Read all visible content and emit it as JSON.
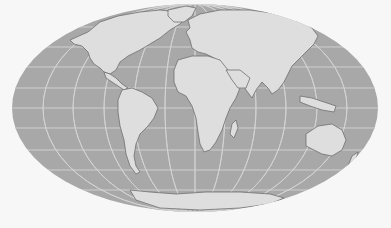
{
  "map": {
    "projection": "Mollweide",
    "type": "world map",
    "colors": {
      "background": "#f7f7f7",
      "ocean": "#a8a8a8",
      "land": "#dedede",
      "graticule": "#d4d4d4",
      "coastline": "#707070"
    },
    "ellipse": {
      "cx": 195,
      "cy": 108,
      "rx": 183,
      "ry": 104
    },
    "parallels_y": [
      27,
      47,
      67,
      88,
      108,
      128,
      150,
      170,
      190
    ],
    "meridian_rx": [
      0,
      30,
      61,
      91,
      122,
      152
    ],
    "continents": [
      {
        "name": "North America",
        "d": "M70,40 L88,32 L100,22 L118,16 L140,12 L160,10 L178,12 L186,18 L180,24 L170,30 L160,38 L150,44 L140,50 L128,56 L120,62 L116,70 L110,74 L104,72 L100,68 L94,64 L90,58 L88,52 L82,46 L74,44 Z"
      },
      {
        "name": "Greenland",
        "d": "M168,10 L186,6 L196,8 L192,16 L184,22 L174,22 L168,16 Z"
      },
      {
        "name": "Central America",
        "d": "M104,72 L110,74 L116,78 L122,84 L128,88 L124,90 L118,86 L112,82 L106,78 Z"
      },
      {
        "name": "South America",
        "d": "M122,90 L132,88 L142,92 L152,98 L158,108 L154,118 L148,126 L140,134 L136,144 L134,156 L136,166 L140,172 L136,174 L130,166 L126,154 L124,140 L120,126 L118,112 L118,100 Z"
      },
      {
        "name": "Europe-Asia",
        "d": "M188,20 L200,14 L220,10 L250,10 L280,14 L300,20 L312,28 L318,36 L314,44 L308,50 L300,58 L292,66 L288,74 L284,82 L278,90 L272,94 L268,88 L262,82 L256,90 L252,98 L246,90 L240,80 L232,76 L224,72 L218,66 L214,58 L206,54 L198,52 L192,48 L190,40 L186,32 L190,28 Z"
      },
      {
        "name": "Africa",
        "d": "M178,60 L192,56 L208,56 L220,60 L228,70 L234,80 L240,88 L236,98 L230,108 L226,118 L222,130 L216,142 L210,150 L204,152 L200,144 L198,132 L196,118 L192,106 L186,96 L178,92 L174,82 L174,70 Z"
      },
      {
        "name": "Arabia",
        "d": "M226,70 L240,70 L250,78 L246,88 L238,88 L232,80 Z"
      },
      {
        "name": "Madagascar",
        "d": "M232,124 L236,120 L238,128 L234,138 L230,134 Z"
      },
      {
        "name": "Southeast Asia Islands",
        "d": "M300,96 L312,98 L324,102 L336,106 L334,112 L322,110 L310,106 L300,102 Z"
      },
      {
        "name": "Australia",
        "d": "M306,134 L318,126 L332,124 L342,130 L346,140 L342,150 L332,156 L322,154 L314,150 L306,146 Z"
      },
      {
        "name": "New Zealand",
        "d": "M352,156 L358,152 L356,160 L348,166 Z"
      },
      {
        "name": "Antarctica",
        "d": "M130,190 L150,192 L176,194 L206,192 L240,192 L270,194 L284,198 L270,204 L240,208 L200,210 L160,208 L136,200 Z"
      }
    ]
  }
}
